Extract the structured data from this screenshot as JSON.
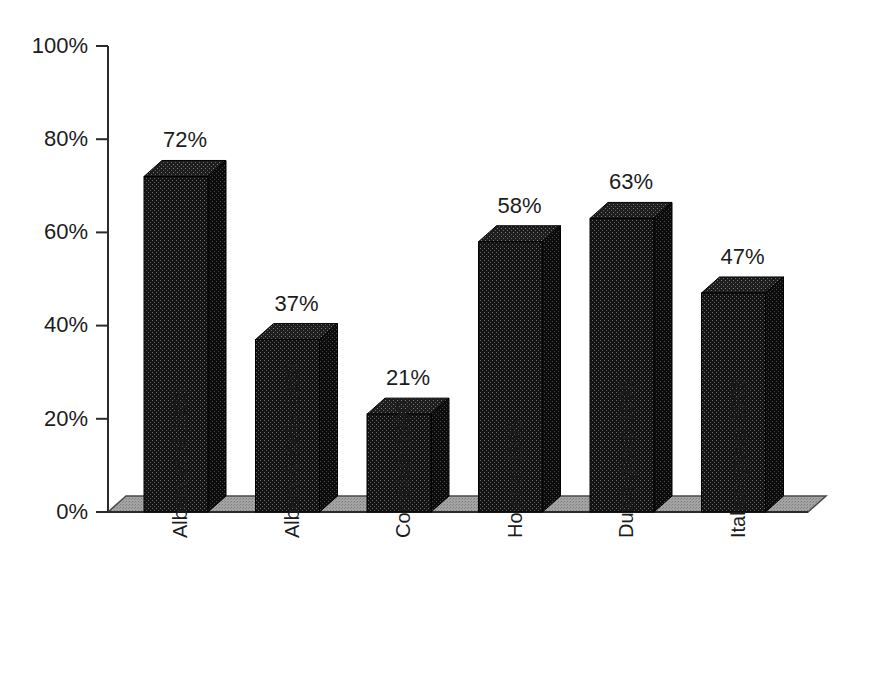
{
  "chart_data": {
    "type": "bar",
    "title": "",
    "subtitle": "",
    "xlabel": "",
    "ylabel": "",
    "ylim": [
      0,
      100
    ],
    "yticks": [
      "0%",
      "20%",
      "40%",
      "60%",
      "80%",
      "100%"
    ],
    "ytick_values": [
      0,
      20,
      40,
      60,
      80,
      100
    ],
    "grid": false,
    "legend": false,
    "legend_position": "none",
    "style": "3d-bar",
    "categories": [
      "Albers et al 1985",
      "Albers & Kelly 1989",
      "Cornblath 1990",
      "Ho et al 1995",
      "Dutch group 1995",
      "Italian group 1996"
    ],
    "values": [
      72,
      37,
      21,
      58,
      63,
      47
    ],
    "value_labels": [
      "72%",
      "37%",
      "21%",
      "58%",
      "63%",
      "47%"
    ],
    "colors": {
      "bar_front": "#191919",
      "bar_top": "#232323",
      "bar_side": "#0f0f0f",
      "floor": "#9a9a9a",
      "floor_edge": "#6f6f6f",
      "axis": "#2b2b2b",
      "text": "#1c1c1c",
      "background": "#ffffff"
    }
  }
}
